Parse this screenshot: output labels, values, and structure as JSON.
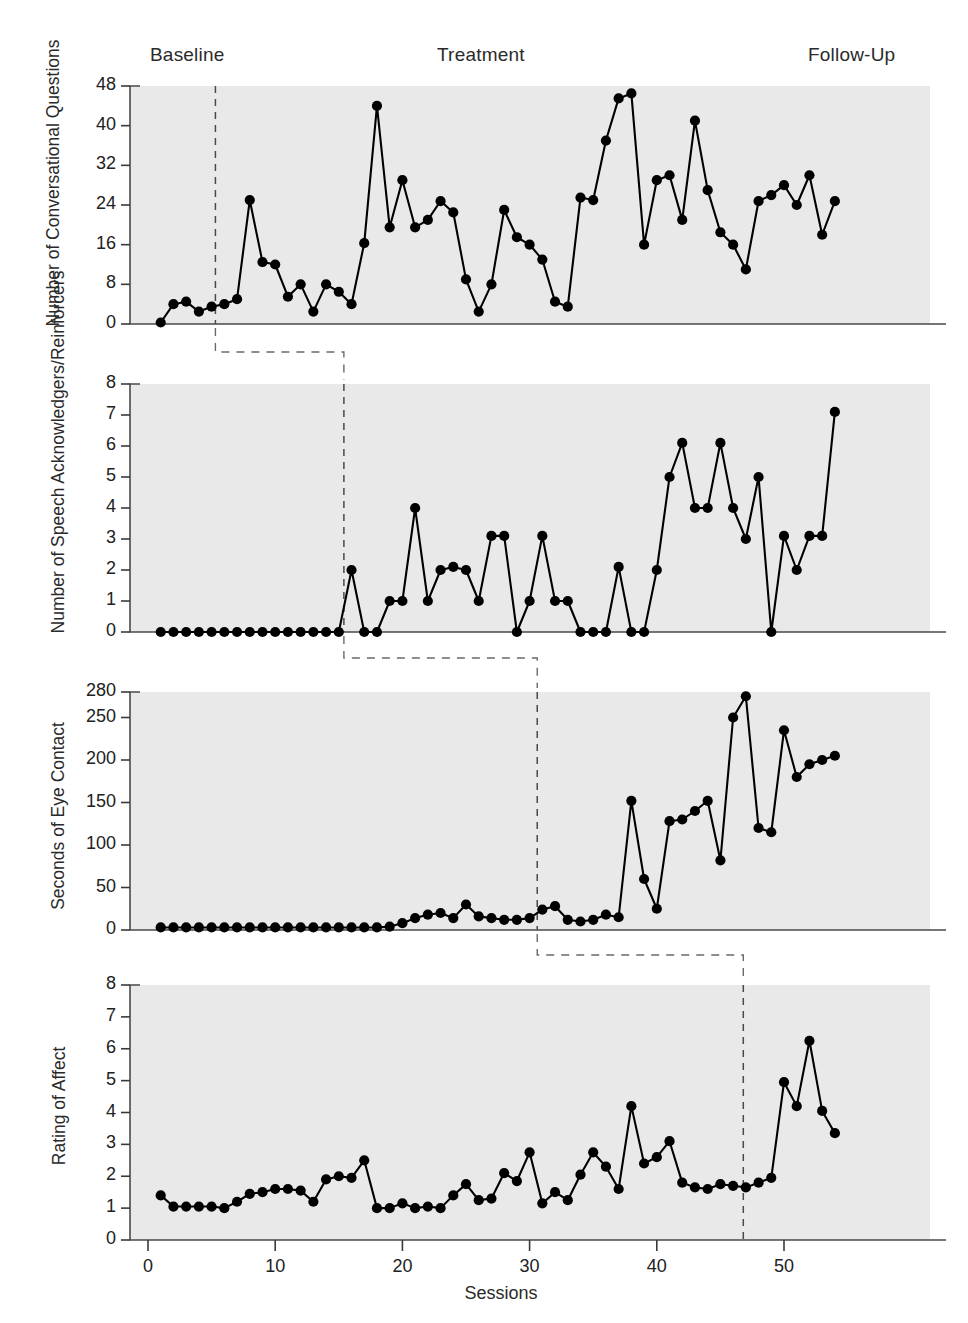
{
  "figure": {
    "xlabel": "Sessions",
    "phases": [
      {
        "name": "Baseline",
        "label_x": 150
      },
      {
        "name": "Treatment",
        "label_x": 437
      },
      {
        "name": "Follow-Up",
        "label_x": 808
      }
    ]
  },
  "chart_data": [
    {
      "type": "line",
      "panel": 1,
      "title": "",
      "ylabel": "Number of Conversational Questions",
      "xlabel": "Sessions",
      "ylim": [
        0,
        48
      ],
      "yticks": [
        0,
        8,
        16,
        24,
        32,
        40,
        48
      ],
      "ytick_labels": [
        "0",
        "8",
        "16",
        "24",
        "32",
        "40",
        "48"
      ],
      "xlim": [
        0,
        55
      ],
      "grid": false,
      "phase_line_x": 5.3,
      "x": [
        1,
        2,
        3,
        4,
        5,
        6,
        7,
        8,
        9,
        10,
        11,
        12,
        13,
        14,
        15,
        16,
        17,
        18,
        19,
        20,
        21,
        22,
        23,
        24,
        25,
        26,
        27,
        28,
        29,
        30,
        31,
        32,
        33,
        34,
        35,
        36,
        37,
        38,
        39,
        40,
        41,
        42,
        43,
        44,
        45,
        46,
        47,
        48,
        49,
        50,
        51,
        52,
        53,
        54
      ],
      "y": [
        0.3,
        4,
        4.5,
        2.5,
        3.5,
        4,
        5,
        25,
        12.5,
        12,
        5.5,
        8,
        2.5,
        8,
        6.5,
        4,
        16.3,
        44,
        19.5,
        29,
        19.5,
        21,
        24.8,
        22.5,
        9,
        2.5,
        8,
        23,
        17.5,
        16,
        13,
        4.5,
        3.5,
        25.5,
        25,
        37,
        45.5,
        46.5,
        16,
        29,
        30,
        21,
        41,
        27,
        18.5,
        16,
        11,
        24.8,
        26,
        28,
        24,
        30,
        18,
        24.8
      ],
      "y_label_note": "Baseline sessions 1-5; Treatment 6-46; Follow-Up 47-54"
    },
    {
      "type": "line",
      "panel": 2,
      "title": "",
      "ylabel": "Number of Speech Acknowledgers/Reinforcers",
      "xlabel": "Sessions",
      "ylim": [
        0,
        8
      ],
      "yticks": [
        0,
        1,
        2,
        3,
        4,
        5,
        6,
        7,
        8
      ],
      "ytick_labels": [
        "0",
        "1",
        "2",
        "3",
        "4",
        "5",
        "6",
        "7",
        "8"
      ],
      "xlim": [
        0,
        55
      ],
      "grid": false,
      "phase_line_x": 15.4,
      "x": [
        1,
        2,
        3,
        4,
        5,
        6,
        7,
        8,
        9,
        10,
        11,
        12,
        13,
        14,
        15,
        16,
        17,
        18,
        19,
        20,
        21,
        22,
        23,
        24,
        25,
        26,
        27,
        28,
        29,
        30,
        31,
        32,
        33,
        34,
        35,
        36,
        37,
        38,
        39,
        40,
        41,
        42,
        43,
        44,
        45,
        46,
        47,
        48,
        49,
        50,
        51,
        52,
        53,
        54
      ],
      "y": [
        0,
        0,
        0,
        0,
        0,
        0,
        0,
        0,
        0,
        0,
        0,
        0,
        0,
        0,
        0,
        2,
        0,
        0,
        1,
        1,
        4,
        1,
        2,
        2.1,
        2,
        1,
        3.1,
        3.1,
        0,
        1,
        3.1,
        1,
        1,
        0,
        0,
        0,
        2.1,
        0,
        0,
        2,
        5,
        6.1,
        4,
        4,
        6.1,
        4,
        3,
        5,
        0,
        3.1,
        2,
        3.1,
        3.1,
        7.1
      ]
    },
    {
      "type": "line",
      "panel": 3,
      "title": "",
      "ylabel": "Seconds of Eye Contact",
      "xlabel": "Sessions",
      "ylim": [
        0,
        280
      ],
      "yticks": [
        0,
        50,
        100,
        150,
        200,
        250,
        280
      ],
      "ytick_labels": [
        "0",
        "50",
        "100",
        "150",
        "200",
        "250",
        "280"
      ],
      "xlim": [
        0,
        55
      ],
      "grid": false,
      "phase_line_x": 30.6,
      "x": [
        1,
        2,
        3,
        4,
        5,
        6,
        7,
        8,
        9,
        10,
        11,
        12,
        13,
        14,
        15,
        16,
        17,
        18,
        19,
        20,
        21,
        22,
        23,
        24,
        25,
        26,
        27,
        28,
        29,
        30,
        31,
        32,
        33,
        34,
        35,
        36,
        37,
        38,
        39,
        40,
        41,
        42,
        43,
        44,
        45,
        46,
        47,
        48,
        49,
        50,
        51,
        52,
        53,
        54
      ],
      "y": [
        3,
        3,
        3,
        3,
        3,
        3,
        3,
        3,
        3,
        3,
        3,
        3,
        3,
        3,
        3,
        3,
        3,
        3,
        4,
        8,
        14,
        18,
        20,
        14,
        30,
        16,
        14,
        12,
        12,
        14,
        24,
        28,
        12,
        10,
        12,
        18,
        15,
        152,
        60,
        25,
        128,
        130,
        140,
        152,
        82,
        250,
        275,
        120,
        115,
        235,
        180,
        195,
        200,
        205,
        190,
        122,
        190,
        255,
        175
      ],
      "y_note": "Baseline-phase values hover near 0-30; Treatment (from session 31) jumps to 60-275"
    },
    {
      "type": "line",
      "panel": 4,
      "title": "",
      "ylabel": "Rating of Affect",
      "xlabel": "Sessions",
      "ylim": [
        0,
        8
      ],
      "yticks": [
        0,
        1,
        2,
        3,
        4,
        5,
        6,
        7,
        8
      ],
      "ytick_labels": [
        "0",
        "1",
        "2",
        "3",
        "4",
        "5",
        "6",
        "7",
        "8"
      ],
      "xlim": [
        0,
        55
      ],
      "grid": false,
      "phase_line_x": 46.8,
      "x": [
        1,
        2,
        3,
        4,
        5,
        6,
        7,
        8,
        9,
        10,
        11,
        12,
        13,
        14,
        15,
        16,
        17,
        18,
        19,
        20,
        21,
        22,
        23,
        24,
        25,
        26,
        27,
        28,
        29,
        30,
        31,
        32,
        33,
        34,
        35,
        36,
        37,
        38,
        39,
        40,
        41,
        42,
        43,
        44,
        45,
        46,
        47,
        48,
        49,
        50,
        51,
        52,
        53,
        54
      ],
      "y": [
        1.4,
        1.05,
        1.05,
        1.05,
        1.05,
        1.0,
        1.2,
        1.45,
        1.5,
        1.6,
        1.6,
        1.55,
        1.2,
        1.9,
        2.0,
        1.95,
        2.5,
        1.0,
        1.0,
        1.15,
        1.0,
        1.05,
        1.0,
        1.4,
        1.75,
        1.25,
        1.3,
        2.1,
        1.85,
        2.75,
        1.15,
        1.5,
        1.25,
        2.05,
        2.75,
        2.3,
        1.6,
        4.2,
        2.4,
        2.6,
        3.1,
        1.8,
        1.65,
        1.6,
        1.75,
        1.7,
        1.65,
        1.8,
        1.95,
        4.95,
        4.2,
        6.25,
        4.05,
        3.35,
        4.1,
        4.85,
        5.0
      ]
    }
  ],
  "axes": {
    "xticks": [
      0,
      10,
      20,
      30,
      40,
      50
    ],
    "xtick_labels": [
      "0",
      "10",
      "20",
      "30",
      "40",
      "50"
    ]
  }
}
